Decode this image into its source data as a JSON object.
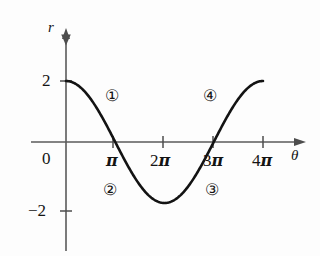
{
  "chart_data": {
    "type": "line",
    "title": "",
    "xlabel": "θ",
    "ylabel": "r",
    "function": "r = 2 cos(θ/2)",
    "x": [
      0,
      3.1416,
      6.2832,
      9.4248,
      12.5664
    ],
    "y": [
      2,
      0,
      -2,
      0,
      2
    ],
    "xlim": [
      0,
      12.5664
    ],
    "ylim": [
      -2.6,
      2.6
    ],
    "grid": false,
    "legend": "none",
    "x_ticks": [
      {
        "value": 3.1416,
        "label_number": "",
        "label_pi": "π"
      },
      {
        "value": 6.2832,
        "label_number": "2",
        "label_pi": "π"
      },
      {
        "value": 9.4248,
        "label_number": "3",
        "label_pi": "π"
      },
      {
        "value": 12.5664,
        "label_number": "4",
        "label_pi": "π"
      }
    ],
    "y_ticks": [
      {
        "value": 2,
        "label": "2"
      },
      {
        "value": -2,
        "label": "−2"
      }
    ],
    "origin_label": "0",
    "annotations": [
      {
        "name": "region-1",
        "label": "①",
        "x": 2.0,
        "y": 1.25
      },
      {
        "name": "region-2",
        "label": "②",
        "x": 1.9,
        "y": -1.0
      },
      {
        "name": "region-3",
        "label": "③",
        "x": 10.0,
        "y": -1.0
      },
      {
        "name": "region-4",
        "label": "④",
        "x": 9.85,
        "y": 1.2
      }
    ],
    "colors": {
      "curve": "#111111",
      "axis": "#4d4d4d",
      "text": "#141414",
      "background": "#fdfdfd"
    }
  },
  "axes": {
    "y_axis_name": "r",
    "x_axis_name": "θ",
    "origin": "0",
    "y_tick_2": "2",
    "y_tick_minus2": "−2"
  },
  "x_tick_labels": {
    "pi": {
      "num": "",
      "sym": "π"
    },
    "two_pi": {
      "num": "2",
      "sym": "π"
    },
    "three_pi": {
      "num": "3",
      "sym": "π"
    },
    "four_pi": {
      "num": "4",
      "sym": "π"
    }
  },
  "regions": {
    "one": "①",
    "two": "②",
    "three": "③",
    "four": "④"
  }
}
